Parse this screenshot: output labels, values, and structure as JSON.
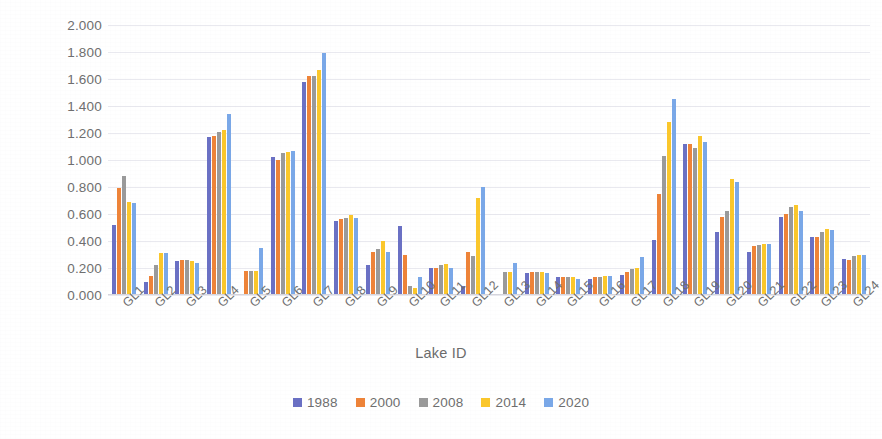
{
  "chart_data": {
    "type": "bar",
    "title": "",
    "xlabel": "Lake ID",
    "ylabel": "Area (km²)",
    "ylabel_base": "Area (km",
    "ylabel_sup": "2",
    "ylabel_tail": ")",
    "ylim": [
      0,
      2.0
    ],
    "y_ticks": [
      "0.000",
      "0.200",
      "0.400",
      "0.600",
      "0.800",
      "1.000",
      "1.200",
      "1.400",
      "1.600",
      "1.800",
      "2.000"
    ],
    "y_tick_values": [
      0.0,
      0.2,
      0.4,
      0.6,
      0.8,
      1.0,
      1.2,
      1.4,
      1.6,
      1.8,
      2.0
    ],
    "grid": true,
    "legend_position": "bottom",
    "categories": [
      "GL1",
      "GL2",
      "GL3",
      "GL4",
      "GL5",
      "GL6",
      "GL7",
      "GL8",
      "GL9",
      "GL10",
      "GL11",
      "GL12",
      "GL13",
      "GL14",
      "GL15",
      "GL16",
      "GL17",
      "GL18",
      "GL19",
      "GL20",
      "GL21",
      "GL22",
      "GL23",
      "GL24"
    ],
    "series": [
      {
        "name": "1988",
        "color": "#6a70c4",
        "values": [
          0.52,
          0.1,
          0.25,
          1.17,
          0.0,
          1.02,
          1.58,
          0.55,
          0.22,
          0.51,
          0.2,
          0.07,
          0.01,
          0.16,
          0.13,
          0.12,
          0.15,
          0.41,
          1.12,
          0.47,
          0.32,
          0.58,
          0.43,
          0.27
        ]
      },
      {
        "name": "2000",
        "color": "#ee8338",
        "values": [
          0.79,
          0.14,
          0.26,
          1.18,
          0.18,
          1.0,
          1.62,
          0.56,
          0.32,
          0.3,
          0.2,
          0.32,
          0.0,
          0.17,
          0.13,
          0.13,
          0.17,
          0.75,
          1.12,
          0.58,
          0.36,
          0.6,
          0.43,
          0.26
        ]
      },
      {
        "name": "2008",
        "color": "#9a9a9a",
        "values": [
          0.88,
          0.22,
          0.26,
          1.21,
          0.18,
          1.05,
          1.62,
          0.57,
          0.34,
          0.07,
          0.22,
          0.29,
          0.17,
          0.17,
          0.13,
          0.13,
          0.19,
          1.03,
          1.09,
          0.62,
          0.37,
          0.65,
          0.47,
          0.29
        ]
      },
      {
        "name": "2014",
        "color": "#fbc72b"
      },
      {
        "name": "2020",
        "color": "#7aa8e8"
      }
    ],
    "series_2014_values": [
      0.69,
      0.31,
      0.25,
      1.22,
      0.18,
      1.06,
      1.67,
      0.59,
      0.4,
      0.05,
      0.23,
      0.72,
      0.17,
      0.17,
      0.13,
      0.14,
      0.2,
      1.28,
      1.18,
      0.86,
      0.38,
      0.67,
      0.49,
      0.3
    ],
    "series_2020_values": [
      0.68,
      0.31,
      0.24,
      1.34,
      0.35,
      1.07,
      1.79,
      0.57,
      0.32,
      0.13,
      0.2,
      0.8,
      0.24,
      0.16,
      0.12,
      0.14,
      0.28,
      1.45,
      1.13,
      0.84,
      0.38,
      0.62,
      0.48,
      0.3
    ],
    "legend_entries": [
      {
        "label": "1988",
        "color": "#6a70c4"
      },
      {
        "label": "2000",
        "color": "#ee8338"
      },
      {
        "label": "2008",
        "color": "#9a9a9a"
      },
      {
        "label": "2014",
        "color": "#fbc72b"
      },
      {
        "label": "2020",
        "color": "#7aa8e8"
      }
    ]
  }
}
